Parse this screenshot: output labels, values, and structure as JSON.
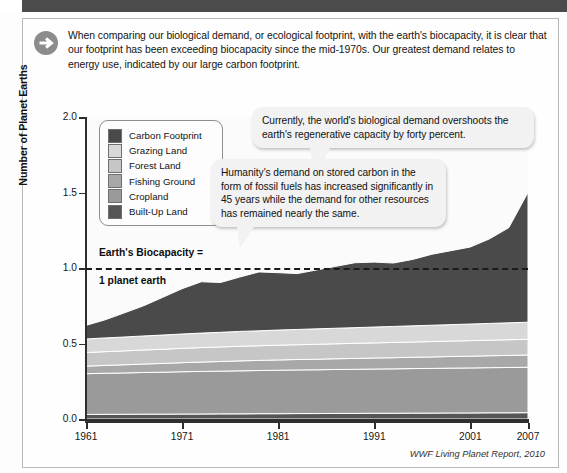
{
  "intro": {
    "icon": "arrow-right-circle-icon",
    "text": "When comparing our biological demand, or ecological footprint, with the earth's biocapacity, it is clear that our footprint has been exceeding biocapacity since the mid-1970s. Our greatest demand relates to energy use, indicated by our large carbon footprint."
  },
  "callouts": [
    {
      "id": "callout-1",
      "text": "Currently, the world's biological demand overshoots the earth's regenerative capacity by forty percent."
    },
    {
      "id": "callout-2",
      "text": "Humanity's demand on stored carbon in the form of fossil fuels has increased significantly in 45 years while the demand for other resources has remained nearly the same."
    }
  ],
  "annotation": {
    "line1": "Earth's Biocapacity =",
    "line2": "1 planet earth",
    "value": 1.0
  },
  "source": "WWF Living Planet Report, 2010",
  "colors": {
    "carbon_footprint": "#4a4a4a",
    "grazing_land": "#d8d8d8",
    "forest_land": "#c6c6c6",
    "fishing_ground": "#a8a8a8",
    "cropland": "#9a9a9a",
    "built_up_land": "#555555",
    "header_bar": "#4b4b4b",
    "axis": "#2e2e2e"
  },
  "chart_data": {
    "type": "area",
    "title": "",
    "xlabel": "",
    "ylabel": "Number of Planet Earths",
    "xlim": [
      1961,
      2007
    ],
    "ylim": [
      0.0,
      2.0
    ],
    "yticks": [
      "0.0",
      "0.5",
      "1.0",
      "1.5",
      "2.0"
    ],
    "ytick_values": [
      0.0,
      0.5,
      1.0,
      1.5,
      2.0
    ],
    "xticks": [
      "1961",
      "1971",
      "1981",
      "1991",
      "2001",
      "2007"
    ],
    "xtick_values": [
      1961,
      1971,
      1981,
      1991,
      2001,
      2007
    ],
    "grid": false,
    "legend_position": "upper-left",
    "stacked": true,
    "x": [
      1961,
      1963,
      1965,
      1967,
      1969,
      1971,
      1973,
      1975,
      1977,
      1979,
      1981,
      1983,
      1985,
      1987,
      1989,
      1991,
      1993,
      1995,
      1997,
      1999,
      2001,
      2003,
      2005,
      2007
    ],
    "series": [
      {
        "name": "Built-Up Land",
        "color": "#555555",
        "values": [
          0.03,
          0.031,
          0.031,
          0.032,
          0.032,
          0.033,
          0.033,
          0.034,
          0.034,
          0.035,
          0.035,
          0.036,
          0.036,
          0.037,
          0.037,
          0.038,
          0.038,
          0.039,
          0.039,
          0.04,
          0.04,
          0.041,
          0.041,
          0.042
        ]
      },
      {
        "name": "Cropland",
        "color": "#9a9a9a",
        "values": [
          0.27,
          0.272,
          0.274,
          0.276,
          0.278,
          0.28,
          0.282,
          0.283,
          0.285,
          0.286,
          0.288,
          0.289,
          0.29,
          0.291,
          0.292,
          0.293,
          0.294,
          0.295,
          0.296,
          0.297,
          0.298,
          0.299,
          0.3,
          0.301
        ]
      },
      {
        "name": "Fishing Ground",
        "color": "#a8a8a8",
        "values": [
          0.05,
          0.052,
          0.054,
          0.056,
          0.058,
          0.06,
          0.062,
          0.064,
          0.066,
          0.067,
          0.068,
          0.069,
          0.07,
          0.071,
          0.072,
          0.073,
          0.074,
          0.075,
          0.076,
          0.077,
          0.078,
          0.079,
          0.08,
          0.081
        ]
      },
      {
        "name": "Forest Land",
        "color": "#c6c6c6",
        "values": [
          0.09,
          0.091,
          0.092,
          0.093,
          0.094,
          0.095,
          0.096,
          0.096,
          0.097,
          0.097,
          0.098,
          0.098,
          0.099,
          0.099,
          0.1,
          0.1,
          0.101,
          0.101,
          0.102,
          0.102,
          0.103,
          0.103,
          0.104,
          0.104
        ]
      },
      {
        "name": "Grazing Land",
        "color": "#d8d8d8",
        "values": [
          0.09,
          0.091,
          0.092,
          0.093,
          0.094,
          0.095,
          0.096,
          0.097,
          0.098,
          0.099,
          0.1,
          0.101,
          0.102,
          0.103,
          0.104,
          0.105,
          0.106,
          0.107,
          0.108,
          0.109,
          0.11,
          0.111,
          0.112,
          0.113
        ]
      },
      {
        "name": "Carbon Footprint",
        "color": "#4a4a4a",
        "values": [
          0.09,
          0.12,
          0.16,
          0.2,
          0.25,
          0.3,
          0.34,
          0.33,
          0.36,
          0.39,
          0.38,
          0.37,
          0.39,
          0.41,
          0.43,
          0.43,
          0.42,
          0.44,
          0.47,
          0.49,
          0.51,
          0.56,
          0.63,
          0.86
        ]
      }
    ],
    "totals": [
      0.62,
      0.657,
      0.703,
      0.75,
      0.806,
      0.863,
      0.909,
      0.904,
      0.94,
      0.974,
      0.969,
      0.963,
      0.987,
      1.012,
      1.035,
      1.039,
      1.033,
      1.057,
      1.091,
      1.115,
      1.139,
      1.193,
      1.267,
      1.501
    ],
    "legend_order": [
      "Carbon Footprint",
      "Grazing Land",
      "Forest Land",
      "Fishing Ground",
      "Cropland",
      "Built-Up Land"
    ]
  }
}
